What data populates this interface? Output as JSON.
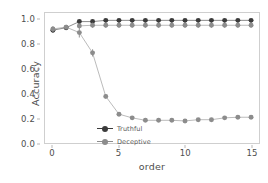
{
  "chart_data": {
    "type": "line",
    "title": "",
    "xlabel": "order",
    "ylabel": "Accuracy",
    "xlim": [
      -0.6,
      15.6
    ],
    "ylim": [
      0.0,
      1.06
    ],
    "xticks": [
      0,
      5,
      10,
      15
    ],
    "xticklabels": [
      "0",
      "5",
      "10",
      "15"
    ],
    "yticks": [
      0.0,
      0.2,
      0.4,
      0.6,
      0.8,
      1.0
    ],
    "yticklabels": [
      "0.0",
      "0.2",
      "0.4",
      "0.6",
      "0.8",
      "1.0"
    ],
    "grid": false,
    "legend_position": "lower left",
    "x": [
      0,
      1,
      2,
      3,
      4,
      5,
      6,
      7,
      8,
      9,
      10,
      11,
      12,
      13,
      14,
      15
    ],
    "series": [
      {
        "name": "Truthful",
        "color": "#3b3b3b",
        "values": [
          0.92,
          0.94,
          0.99,
          0.99,
          1.0,
          1.0,
          1.0,
          1.0,
          1.0,
          1.0,
          1.0,
          1.0,
          1.0,
          1.0,
          1.0,
          1.0
        ],
        "err_low": [
          0.02,
          0.015,
          0.025,
          0.025,
          0.02,
          0.02,
          0.02,
          0.02,
          0.02,
          0.02,
          0.02,
          0.02,
          0.02,
          0.02,
          0.02,
          0.02
        ],
        "err_high": [
          0.02,
          0.015,
          0.01,
          0.01,
          0.005,
          0.005,
          0.005,
          0.005,
          0.005,
          0.005,
          0.005,
          0.005,
          0.005,
          0.005,
          0.005,
          0.005
        ]
      },
      {
        "name": "Deceptive",
        "color": "#8c8c8c",
        "values": [
          0.93,
          0.945,
          0.9,
          0.735,
          0.38,
          0.235,
          0.205,
          0.185,
          0.185,
          0.185,
          0.18,
          0.19,
          0.19,
          0.205,
          0.21,
          0.21
        ],
        "err_low": [
          0.025,
          0.02,
          0.04,
          0.03,
          0.02,
          0.015,
          0.012,
          0.01,
          0.01,
          0.01,
          0.01,
          0.01,
          0.01,
          0.01,
          0.01,
          0.01
        ],
        "err_high": [
          0.025,
          0.02,
          0.065,
          0.03,
          0.02,
          0.015,
          0.012,
          0.01,
          0.01,
          0.01,
          0.01,
          0.01,
          0.01,
          0.01,
          0.01,
          0.01
        ]
      },
      {
        "name": "Deceptive upper band",
        "color": "#8c8c8c",
        "values": [
          null,
          null,
          0.955,
          0.96,
          0.96,
          0.96,
          0.96,
          0.96,
          0.96,
          0.96,
          0.96,
          0.96,
          0.96,
          0.96,
          0.96,
          0.96
        ],
        "err_low": [
          0,
          0,
          0.02,
          0.02,
          0.02,
          0.02,
          0.02,
          0.02,
          0.02,
          0.02,
          0.02,
          0.02,
          0.02,
          0.02,
          0.02,
          0.02
        ],
        "err_high": [
          0,
          0,
          0.02,
          0.02,
          0.02,
          0.02,
          0.02,
          0.02,
          0.02,
          0.02,
          0.02,
          0.02,
          0.02,
          0.02,
          0.02,
          0.02
        ]
      }
    ],
    "legend": [
      {
        "label": "Truthful",
        "color": "#3b3b3b"
      },
      {
        "label": "Deceptive",
        "color": "#8c8c8c"
      }
    ],
    "colors": {
      "truthful": "#3b3b3b",
      "deceptive": "#8c8c8c",
      "axis": "#cfcfcf",
      "text": "#4d4d4d",
      "background": "#ffffff"
    }
  }
}
